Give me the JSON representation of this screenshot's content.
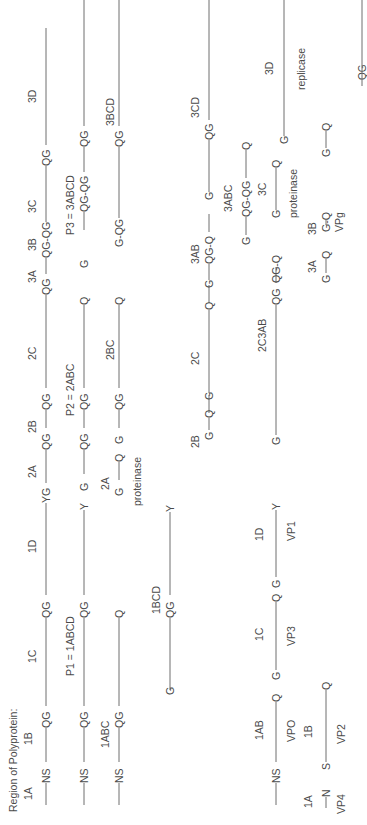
{
  "diagram": {
    "title": "Region of Polyprotein:",
    "orientation": "rotated-90-ccw",
    "line_color": "#6e6e6e",
    "text_color": "#4a4a4a",
    "rows": [
      {
        "id": "row1-polyprotein",
        "x": 46,
        "segments": [
          "1A",
          "1B",
          "1C",
          "1D",
          "2A",
          "2B",
          "2C",
          "3A",
          "3B",
          "3C",
          "3D"
        ],
        "sites": [
          "NS",
          "QG",
          "QG",
          "YG",
          "QG",
          "QG",
          "QG",
          "QG-QG",
          "QG"
        ]
      },
      {
        "id": "row2-primary",
        "x": 84,
        "labels": [
          "P1 = 1ABCD",
          "P2 = 2ABC",
          "P3 = 3ABCD"
        ],
        "sites": [
          "NS",
          "QG",
          "QG",
          "Y",
          "G",
          "QG",
          "QG",
          "Q",
          "G",
          "QG-QG",
          "QG"
        ]
      },
      {
        "id": "row3-intermediates",
        "x": 119,
        "labels": [
          "1ABC",
          "2A",
          "proteinase",
          "2BC",
          "3BCD"
        ],
        "sites": [
          "NS",
          "QG",
          "Q",
          "G",
          "Q",
          "G",
          "QG",
          "Q",
          "G-QG",
          "QG"
        ]
      },
      {
        "id": "row4-1bcd",
        "x": 170,
        "labels": [
          "1BCD"
        ],
        "sites": [
          "G",
          "QG",
          "Y"
        ]
      },
      {
        "id": "row5-secondary",
        "x": 209,
        "labels": [
          "2B",
          "2C",
          "3AB",
          "3CD"
        ],
        "sites": [
          "G",
          "Q",
          "G",
          "Q",
          "G",
          "QG-Q",
          "G",
          "QG"
        ]
      },
      {
        "id": "row6-tertiary",
        "x": 276,
        "labels": [
          "1AB",
          "VPO",
          "1C",
          "VP3",
          "1D",
          "VP1",
          "2C3AB",
          "3ABC",
          "3C",
          "proteinase",
          "3D",
          "replicase"
        ],
        "sites": [
          "NS",
          "Q",
          "G",
          "Q",
          "G",
          "Y",
          "G",
          "QG",
          "QG-Q",
          "G",
          "QG-QG",
          "Q",
          "G",
          "Q",
          "G"
        ]
      },
      {
        "id": "row7-final",
        "x": 326,
        "labels": [
          "1A",
          "VP4",
          "1B",
          "VP2",
          "3A",
          "3B",
          "VPg"
        ],
        "sites": [
          "N",
          "S",
          "Q",
          "G",
          "Q",
          "G-Q",
          "G",
          "Q"
        ]
      }
    ]
  },
  "text": {
    "title": "Region of Polyprotein:",
    "r1": {
      "1A": "1A",
      "1B": "1B",
      "1C": "1C",
      "1D": "1D",
      "2A": "2A",
      "2B": "2B",
      "2C": "2C",
      "3A": "3A",
      "3B": "3B",
      "3C": "3C",
      "3D": "3D",
      "s1": "NS",
      "s2": "QG",
      "s3": "QG",
      "s4": "YG",
      "s5": "QG",
      "s6": "QG",
      "s7": "QG",
      "s8": "QG-QG",
      "s9": "QG"
    },
    "r2": {
      "p1": "P1 = 1ABCD",
      "p2": "P2 = 2ABC",
      "p3": "P3 = 3ABCD",
      "s1": "NS",
      "s2": "QG",
      "s3": "QG",
      "s4": "Y",
      "s5": "G",
      "s6": "QG",
      "s7": "QG",
      "s8": "Q",
      "s9": "G",
      "s10": "QG-QG",
      "s11": "QG"
    },
    "r3": {
      "l1": "1ABC",
      "l2": "2A",
      "l3": "proteinase",
      "l4": "2BC",
      "l5": "3BCD",
      "s1": "NS",
      "s2": "QG",
      "s3": "Q",
      "s4": "G",
      "s5": "Q",
      "s6": "G",
      "s7": "QG",
      "s8": "Q",
      "s9": "G-QG",
      "s10": "QG"
    },
    "r4": {
      "l1": "1BCD",
      "s1": "G",
      "s2": "QG",
      "s3": "Y"
    },
    "r5": {
      "l1": "2B",
      "l2": "2C",
      "l3": "3AB",
      "l4": "3CD",
      "s1": "G",
      "s2": "Q",
      "s3": "G",
      "s4": "Q",
      "s5": "G",
      "s6": "QG-Q",
      "s7": "G",
      "s8": "QG"
    },
    "r6": {
      "l1": "1AB",
      "l2": "VPO",
      "l3": "1C",
      "l4": "VP3",
      "l5": "1D",
      "l6": "VP1",
      "l7": "2C3AB",
      "l8": "3ABC",
      "l9": "3C",
      "l10": "proteinase",
      "l11": "3D",
      "l12": "replicase",
      "s1": "NS",
      "s2": "Q",
      "s3": "G",
      "s4": "Q",
      "s5": "G",
      "s6": "Y",
      "s7": "G",
      "s8": "QG",
      "s9": "QG-Q",
      "s10": "G",
      "s11": "QG-QG",
      "s12": "Q",
      "s13": "G",
      "s14": "Q",
      "s15": "G"
    },
    "r7": {
      "l1": "1A",
      "l2": "VP4",
      "l3": "1B",
      "l4": "VP2",
      "l5": "3A",
      "l6": "3B",
      "l7": "VPg",
      "s1": "N",
      "s2": "S",
      "s3": "Q",
      "s4": "G",
      "s5": "Q",
      "s6": "G-Q",
      "s7": "G",
      "s8": "Q",
      "s9": "QG"
    }
  }
}
